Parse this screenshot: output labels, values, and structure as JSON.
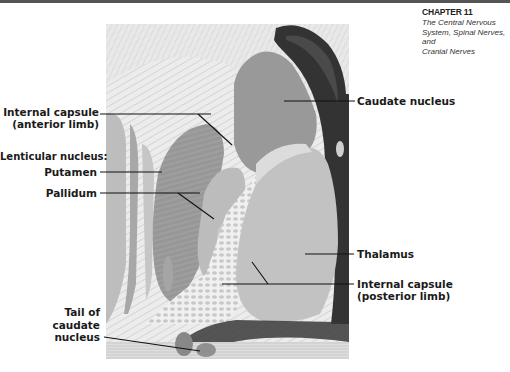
{
  "header": {
    "chapter": "CHAPTER 11",
    "subtitle_lines": [
      "The Central Nervous",
      "System, Spinal Nerves, and",
      "Cranial Nerves"
    ]
  },
  "figure": {
    "type": "anatomical illustration",
    "labels": {
      "internal_capsule_anterior_1": "Internal capsule",
      "internal_capsule_anterior_2": "(anterior limb)",
      "lenticular_nucleus": "Lenticular nucleus:",
      "putamen": "Putamen",
      "pallidum": "Pallidum",
      "tail_1": "Tail of",
      "tail_2": "caudate",
      "tail_3": "nucleus",
      "caudate_nucleus": "Caudate nucleus",
      "thalamus": "Thalamus",
      "internal_capsule_posterior_1": "Internal capsule",
      "internal_capsule_posterior_2": "(posterior limb)"
    },
    "colors": {
      "background_fibers": "#e6e6e6",
      "caudate": "#9a9a9a",
      "ventricle": "#2f2f2f",
      "thalamus": "#c2c2c2",
      "putamen": "#959595",
      "pallidum": "#bdbdbd",
      "leader_line": "#111111"
    }
  }
}
